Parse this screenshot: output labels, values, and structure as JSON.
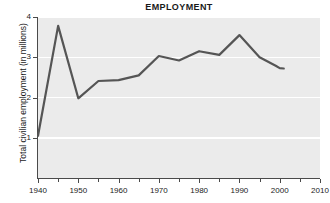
{
  "chart_data": {
    "type": "line",
    "title": "EMPLOYMENT",
    "xlabel": "",
    "ylabel": "Total civilian employment (in millions)",
    "xlim": [
      1940,
      2010
    ],
    "ylim": [
      0,
      4
    ],
    "grid": true,
    "legend": "none",
    "series": [
      {
        "name": "Total civilian employment",
        "color": "#555555",
        "x": [
          1940,
          1945,
          1950,
          1955,
          1960,
          1965,
          1970,
          1975,
          1980,
          1985,
          1990,
          1995,
          1999,
          2000,
          2001
        ],
        "values": [
          1.05,
          3.78,
          1.98,
          2.41,
          2.43,
          2.55,
          3.03,
          2.92,
          3.15,
          3.06,
          3.55,
          3.0,
          2.79,
          2.73,
          2.72
        ]
      }
    ],
    "x_ticks_major": [
      1940,
      1950,
      1960,
      1970,
      1980,
      1990,
      2000,
      2010
    ],
    "x_ticks_minor": [
      1945,
      1955,
      1965,
      1975,
      1985,
      1995,
      2005
    ],
    "x_tick_labels": [
      "1940",
      "1950",
      "1960",
      "1970",
      "1980",
      "1990",
      "2000",
      "2010"
    ],
    "y_ticks": [
      1,
      2,
      3,
      4
    ],
    "y_tick_labels": [
      "1",
      "2",
      "3",
      "4"
    ],
    "colors": {
      "plot_background": "#ebebeb",
      "gridline": "#ffffff",
      "axis": "#4a4a4a",
      "line": "#555555",
      "text": "#1a1a1a"
    }
  }
}
